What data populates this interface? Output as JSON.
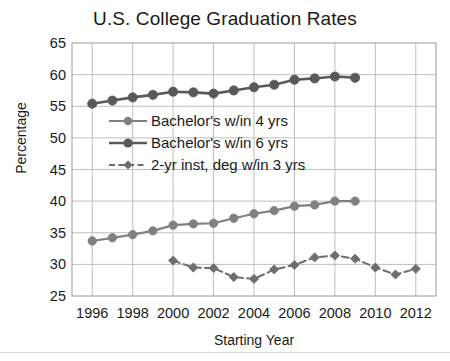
{
  "chart_data": {
    "type": "line",
    "title": "U.S. College Graduation Rates",
    "xlabel": "Starting Year",
    "ylabel": "Percentage",
    "xlim": [
      1995,
      2013
    ],
    "ylim": [
      25,
      65
    ],
    "ytick_labels": [
      "65",
      "60",
      "55",
      "50",
      "45",
      "40",
      "35",
      "30",
      "25"
    ],
    "ytick_values": [
      65,
      60,
      55,
      50,
      45,
      40,
      35,
      30,
      25
    ],
    "xtick_labels": [
      "1996",
      "1998",
      "2000",
      "2002",
      "2004",
      "2006",
      "2008",
      "2010",
      "2012"
    ],
    "xtick_values": [
      1996,
      1998,
      2000,
      2002,
      2004,
      2006,
      2008,
      2010,
      2012
    ],
    "grid": true,
    "legend_position": "upper-left-inside",
    "series": [
      {
        "name": "Bachelor's w/in 4 yrs",
        "marker": "circle",
        "linestyle": "solid",
        "color": "#808080",
        "x": [
          1996,
          1997,
          1998,
          1999,
          2000,
          2001,
          2002,
          2003,
          2004,
          2005,
          2006,
          2007,
          2008,
          2009
        ],
        "values": [
          33.7,
          34.2,
          34.7,
          35.3,
          36.2,
          36.4,
          36.5,
          37.3,
          38.0,
          38.5,
          39.2,
          39.4,
          40.0,
          40.0
        ]
      },
      {
        "name": "Bachelor's w/in 6 yrs",
        "marker": "circle",
        "linestyle": "solid",
        "color": "#595959",
        "x": [
          1996,
          1997,
          1998,
          1999,
          2000,
          2001,
          2002,
          2003,
          2004,
          2005,
          2006,
          2007,
          2008,
          2009
        ],
        "values": [
          55.4,
          55.9,
          56.4,
          56.8,
          57.3,
          57.2,
          57.0,
          57.5,
          58.0,
          58.4,
          59.2,
          59.4,
          59.7,
          59.5
        ]
      },
      {
        "name": "2-yr inst, deg w/in 3 yrs",
        "marker": "diamond",
        "linestyle": "dashed",
        "color": "#6e6e6e",
        "x": [
          2000,
          2001,
          2002,
          2003,
          2004,
          2005,
          2006,
          2007,
          2008,
          2009,
          2010,
          2011,
          2012
        ],
        "values": [
          30.6,
          29.5,
          29.4,
          28.0,
          27.7,
          29.2,
          29.9,
          31.1,
          31.4,
          30.9,
          29.5,
          28.4,
          29.3
        ]
      }
    ]
  }
}
